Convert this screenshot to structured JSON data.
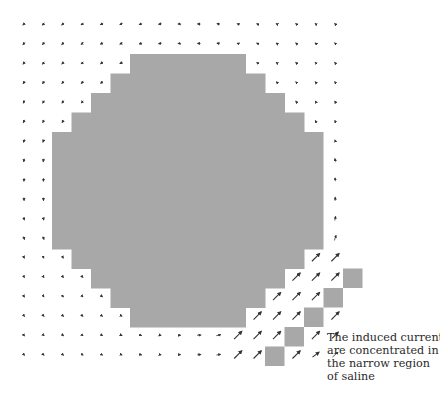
{
  "figure": {
    "colors": {
      "background": "#ffffff",
      "tissue": "#a8a8a8",
      "arrow": "#333333"
    },
    "grid": {
      "origin_x": 24,
      "origin_y": 24,
      "spacing": 19.45,
      "cols": 17,
      "rows": 18
    },
    "body_rows": [
      {
        "y0": 54,
        "y1": 73.5,
        "x0": 130,
        "x1": 246
      },
      {
        "y0": 73.5,
        "y1": 93,
        "x0": 110.5,
        "x1": 265.5
      },
      {
        "y0": 93,
        "y1": 112.5,
        "x0": 91,
        "x1": 285
      },
      {
        "y0": 112.5,
        "y1": 132,
        "x0": 71.5,
        "x1": 304.5
      },
      {
        "y0": 132,
        "y1": 249,
        "x0": 52,
        "x1": 323.5
      },
      {
        "y0": 249,
        "y1": 268.5,
        "x0": 71.5,
        "x1": 304.5
      },
      {
        "y0": 268.5,
        "y1": 288,
        "x0": 91,
        "x1": 285
      },
      {
        "y0": 288,
        "y1": 307.5,
        "x0": 110.5,
        "x1": 265.5
      },
      {
        "y0": 307.5,
        "y1": 327,
        "x0": 130,
        "x1": 246
      }
    ],
    "isolated_squares": [
      {
        "x": 343,
        "y": 268.5
      },
      {
        "x": 323.5,
        "y": 288
      },
      {
        "x": 304,
        "y": 307.5
      },
      {
        "x": 284.5,
        "y": 327
      },
      {
        "x": 265,
        "y": 346.5
      }
    ],
    "annotation": {
      "lines": [
        "The induced currents",
        "are concentrated in",
        "the narrow region",
        "of saline"
      ]
    }
  }
}
